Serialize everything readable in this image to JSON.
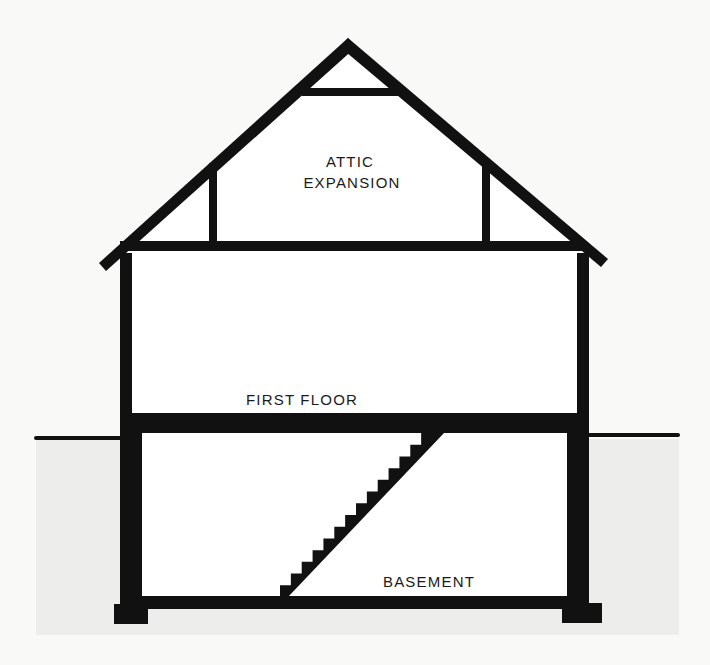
{
  "diagram": {
    "colors": {
      "background": "#f9f9f8",
      "ground": "#ededec",
      "line": "#111111",
      "interior": "#ffffff",
      "text": "#1a1a1a"
    },
    "labels": {
      "attic_line1": "ATTIC",
      "attic_line2": "EXPANSION",
      "first_floor": "FIRST FLOOR",
      "basement": "BASEMENT"
    },
    "components": [
      "roof",
      "collar-tie",
      "knee-walls",
      "attic-floor-joist",
      "exterior-walls",
      "first-floor-slab",
      "basement-stairs",
      "basement-slab",
      "footings",
      "grade-line"
    ],
    "stair_steps": 14
  }
}
